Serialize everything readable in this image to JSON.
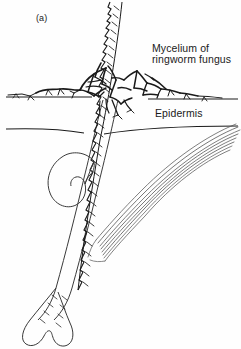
{
  "figure": {
    "panel_label": "(a)",
    "background_color": "#fefefe",
    "ink_color": "#1a1a1a",
    "width": 241,
    "height": 349
  },
  "labels": {
    "mycelium_line1": "Mycelium of",
    "mycelium_line2": "ringworm fungus",
    "epidermis": "Epidermis"
  },
  "structures": {
    "hair_shaft": "hair-shaft",
    "hair_follicle": "hair-follicle",
    "hair_bulb": "hair-bulb",
    "sebaceous_gland": "sebaceous-gland",
    "arrector_pili_muscle": "arrector-pili-muscle",
    "skin_surface": "skin-surface-line",
    "epidermis_base": "epidermis-base-line",
    "mycelium_network": "mycelium-network"
  }
}
